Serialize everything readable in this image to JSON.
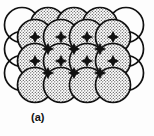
{
  "figure": {
    "caption": "(a)",
    "kind": "crystal-structure-sphere-packing-diagram",
    "background_color": "#fdfdfd",
    "stroke_color": "#111111",
    "shaded_fill_color": "#d9d9d9",
    "stipple_dot_color": "#3a3a3a",
    "unshaded_fill_color": "#ffffff",
    "overlap_fill_color": "#111111",
    "stroke_width": 1.7,
    "lattice": {
      "rows": 4,
      "cols": 5,
      "circle_radius": 17.5,
      "col_spacing": 26.0,
      "row_spacing": 24.0,
      "origin_x": 22.0,
      "origin_y": 25.0,
      "description": "Overlapping close-packed spheres; alternating shaded (stippled) and unshaded circles with dark lens-shaped overlap regions."
    },
    "circles": [
      {
        "cx": 22.0,
        "cy": 25.0,
        "shaded": false
      },
      {
        "cx": 48.0,
        "cy": 25.0,
        "shaded": true
      },
      {
        "cx": 74.0,
        "cy": 25.0,
        "shaded": true
      },
      {
        "cx": 100.0,
        "cy": 25.0,
        "shaded": true
      },
      {
        "cx": 126.0,
        "cy": 25.0,
        "shaded": false
      },
      {
        "cx": 22.0,
        "cy": 49.0,
        "shaded": false
      },
      {
        "cx": 48.0,
        "cy": 49.0,
        "shaded": true
      },
      {
        "cx": 74.0,
        "cy": 49.0,
        "shaded": true
      },
      {
        "cx": 100.0,
        "cy": 49.0,
        "shaded": true
      },
      {
        "cx": 126.0,
        "cy": 49.0,
        "shaded": false
      },
      {
        "cx": 22.0,
        "cy": 73.0,
        "shaded": false
      },
      {
        "cx": 48.0,
        "cy": 73.0,
        "shaded": true
      },
      {
        "cx": 74.0,
        "cy": 73.0,
        "shaded": true
      },
      {
        "cx": 100.0,
        "cy": 73.0,
        "shaded": true
      },
      {
        "cx": 126.0,
        "cy": 73.0,
        "shaded": false
      },
      {
        "cx": 35.0,
        "cy": 37.0,
        "shaded": true
      },
      {
        "cx": 61.0,
        "cy": 37.0,
        "shaded": true
      },
      {
        "cx": 87.0,
        "cy": 37.0,
        "shaded": true
      },
      {
        "cx": 113.0,
        "cy": 37.0,
        "shaded": true
      },
      {
        "cx": 35.0,
        "cy": 61.0,
        "shaded": true
      },
      {
        "cx": 61.0,
        "cy": 61.0,
        "shaded": true
      },
      {
        "cx": 87.0,
        "cy": 61.0,
        "shaded": true
      },
      {
        "cx": 113.0,
        "cy": 61.0,
        "shaded": true
      },
      {
        "cx": 35.0,
        "cy": 85.0,
        "shaded": true
      },
      {
        "cx": 61.0,
        "cy": 85.0,
        "shaded": true
      },
      {
        "cx": 87.0,
        "cy": 85.0,
        "shaded": true
      },
      {
        "cx": 113.0,
        "cy": 85.0,
        "shaded": true
      }
    ],
    "nodes": [
      {
        "cx": 35.0,
        "cy": 37.0
      },
      {
        "cx": 61.0,
        "cy": 37.0
      },
      {
        "cx": 87.0,
        "cy": 37.0
      },
      {
        "cx": 113.0,
        "cy": 37.0
      },
      {
        "cx": 48.0,
        "cy": 49.0
      },
      {
        "cx": 74.0,
        "cy": 49.0
      },
      {
        "cx": 100.0,
        "cy": 49.0
      },
      {
        "cx": 35.0,
        "cy": 61.0
      },
      {
        "cx": 61.0,
        "cy": 61.0
      },
      {
        "cx": 87.0,
        "cy": 61.0
      },
      {
        "cx": 113.0,
        "cy": 61.0
      },
      {
        "cx": 48.0,
        "cy": 73.0
      },
      {
        "cx": 74.0,
        "cy": 73.0
      },
      {
        "cx": 100.0,
        "cy": 73.0
      }
    ]
  }
}
